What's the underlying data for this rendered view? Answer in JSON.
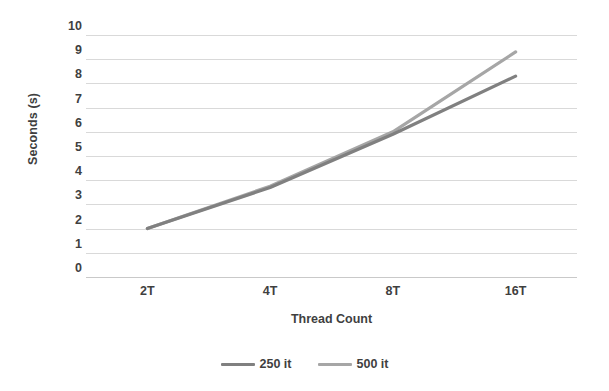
{
  "chart_data": {
    "type": "line",
    "title": "",
    "subtitle": "",
    "xlabel": "Thread Count",
    "ylabel": "Seconds (s)",
    "categories": [
      "2T",
      "4T",
      "8T",
      "16T"
    ],
    "series": [
      {
        "name": "250 it",
        "color": "#808080",
        "values": [
          2.0,
          3.7,
          5.9,
          8.3
        ]
      },
      {
        "name": "500 it",
        "color": "#a6a6a6",
        "values": [
          2.0,
          3.75,
          6.0,
          9.3
        ]
      }
    ],
    "ylim": [
      0,
      10
    ],
    "ytick_step": 1,
    "yticks": [
      "10",
      "9",
      "8",
      "7",
      "6",
      "5",
      "4",
      "3",
      "2",
      "1",
      "0"
    ],
    "grid": true,
    "grid_axis": "y",
    "grid_color": "#d9d9d9",
    "legend_position": "bottom"
  },
  "axes": {
    "y_title": "Seconds (s)",
    "x_title": "Thread Count"
  },
  "legend": {
    "entries": [
      {
        "label": "250 it",
        "color": "#808080"
      },
      {
        "label": "500 it",
        "color": "#a6a6a6"
      }
    ]
  }
}
